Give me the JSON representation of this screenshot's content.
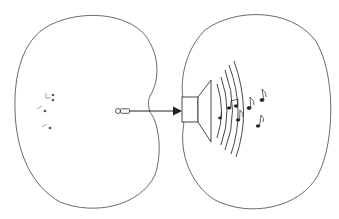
{
  "diagram": {
    "description": "Two kidney-shaped outlines; left contains faint music notes and a small plug/microphone connected by a line with arrow into a loudspeaker on the right outline, which emits sound waves and music notes.",
    "left_region": {
      "label": "",
      "notes": [
        "note",
        "note",
        "note"
      ]
    },
    "connector": {
      "type": "arrow",
      "from": "plug",
      "to": "speaker"
    },
    "right_region": {
      "label": "",
      "speaker": "loudspeaker",
      "wave_count": 5,
      "notes": [
        "♪",
        "♪",
        "♫",
        "♪",
        "♪",
        "♪"
      ]
    },
    "colors": {
      "stroke": "#333333",
      "background": "#ffffff"
    }
  }
}
